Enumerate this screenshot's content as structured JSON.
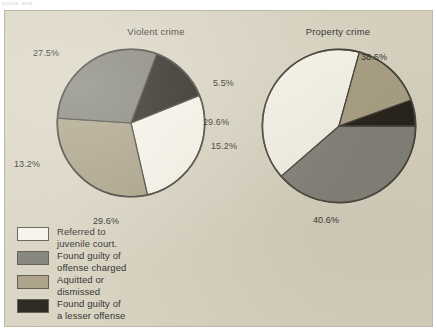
{
  "page_bleed_text": "police and",
  "figure": {
    "background_color": "#d8d2c0",
    "border_color": "#bfb8a4"
  },
  "legend": {
    "name": "disposition-legend",
    "items": [
      {
        "label": "Referred to\njuvenile court.",
        "color": "#f7f4ea",
        "swatch_name": "swatch-referred-to-juvenile-court"
      },
      {
        "label": "Found guilty of\noffense charged",
        "color": "#7b7a72",
        "swatch_name": "swatch-found-guilty-offense-charged"
      },
      {
        "label": "Aquitted or\ndismissed",
        "color": "#a59b80",
        "swatch_name": "swatch-aquitted-or-dismissed"
      },
      {
        "label": "Found guilty of\na lesser offense",
        "color": "#19150f",
        "swatch_name": "swatch-found-guilty-lesser-offense"
      }
    ]
  },
  "chart_data": [
    {
      "type": "pie",
      "title": "Violent crime",
      "categories": [
        "Referred to juvenile court.",
        "Aquitted or dismissed",
        "Found guilty of offense charged",
        "Found guilty of a lesser offense"
      ],
      "values": [
        27.5,
        29.6,
        29.6,
        13.2
      ],
      "labels": [
        "27.5%",
        "29.6%",
        "29.6%",
        "13.2%"
      ],
      "colors": [
        "#f7f4ea",
        "#a59b80",
        "#7b7a72",
        "#19150f"
      ],
      "units": "percent",
      "start_angle_deg": -22,
      "legend_position": "bottom-left"
    },
    {
      "type": "pie",
      "title": "Property crime",
      "categories": [
        "Found guilty of offense charged",
        "Referred to juvenile court.",
        "Aquitted or dismissed",
        "Found guilty of a lesser offense"
      ],
      "values": [
        38.6,
        40.6,
        15.2,
        5.5
      ],
      "labels": [
        "38.6%",
        "40.6%",
        "15.2%",
        "5.5%"
      ],
      "colors": [
        "#7b7a72",
        "#f7f4ea",
        "#a59b80",
        "#19150f"
      ],
      "units": "percent",
      "start_angle_deg": 0,
      "legend_position": "bottom-left"
    }
  ]
}
